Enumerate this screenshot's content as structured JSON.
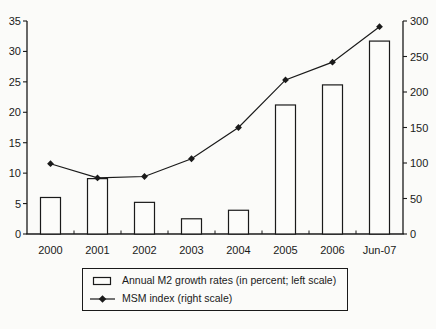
{
  "figure": {
    "background": "#fbfbf9",
    "ink": "#1a1a1a",
    "bar_fill": "#fcfcfa"
  },
  "chart_data": {
    "type": "bar",
    "subtype": "bar-and-line-combo",
    "categories": [
      "2000",
      "2001",
      "2002",
      "2003",
      "2004",
      "2005",
      "2006",
      "Jun-07"
    ],
    "series": [
      {
        "name": "Annual M2 growth rates (in percent; left scale)",
        "type": "bar",
        "axis": "left",
        "values": [
          6.0,
          9.1,
          5.2,
          2.5,
          3.9,
          21.2,
          24.5,
          31.7
        ]
      },
      {
        "name": "MSM index (right scale)",
        "type": "line",
        "axis": "right",
        "marker": "diamond",
        "values": [
          99,
          79,
          81,
          106,
          150,
          217,
          242,
          292
        ]
      }
    ],
    "left_axis": {
      "min": 0,
      "max": 35,
      "ticks": [
        0,
        5,
        10,
        15,
        20,
        25,
        30,
        35
      ]
    },
    "right_axis": {
      "min": 0,
      "max": 300,
      "ticks": [
        0,
        50,
        100,
        150,
        200,
        250,
        300
      ]
    },
    "title": "",
    "xlabel": "",
    "ylabel": "",
    "grid": false,
    "legend_position": "bottom"
  },
  "legend": {
    "items": [
      {
        "swatch": "bar",
        "label": "Annual M2 growth rates (in percent; left scale)"
      },
      {
        "swatch": "line-diamond",
        "label": "MSM index (right scale)"
      }
    ]
  }
}
